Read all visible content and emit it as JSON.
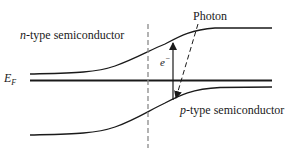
{
  "diagram": {
    "title": "",
    "labels": {
      "n_type": {
        "italic": "n",
        "rest": "-type semiconductor"
      },
      "p_type": {
        "italic": "p",
        "rest": "-type semiconductor"
      },
      "photon": "Photon",
      "electron": {
        "base": "e",
        "sup": "−"
      },
      "fermi": {
        "base": "E",
        "sub": "F"
      }
    },
    "colors": {
      "line": "#1a1a1a",
      "dashed": "#8a8a8a",
      "background": "#ffffff"
    },
    "elements": [
      "n-side conduction band edge (bends up across junction)",
      "Fermi level E_F (flat)",
      "p-side valence band edge (bends up across junction)",
      "junction (dashed vertical line)",
      "electron excitation arrow (upward)",
      "photon (dashed arrow)"
    ]
  }
}
